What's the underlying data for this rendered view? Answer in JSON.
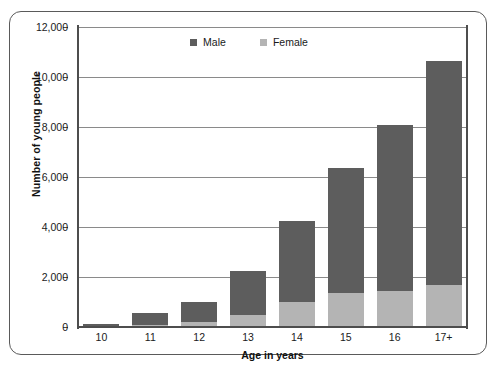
{
  "chart_data": {
    "type": "bar",
    "subtype": "stacked",
    "title": "",
    "xlabel": "Age in years",
    "ylabel": "Number of young people",
    "categories": [
      "10",
      "11",
      "12",
      "13",
      "14",
      "15",
      "16",
      "17+"
    ],
    "series": [
      {
        "name": "Female",
        "color": "#b4b4b4",
        "values": [
          40,
          80,
          200,
          500,
          1000,
          1350,
          1450,
          1700
        ]
      },
      {
        "name": "Male",
        "color": "#5d5d5d",
        "values": [
          90,
          470,
          800,
          1750,
          3250,
          5000,
          6650,
          8950
        ]
      }
    ],
    "totals": [
      130,
      550,
      1000,
      2250,
      4250,
      6350,
      8100,
      10650
    ],
    "ylim": [
      0,
      12000
    ],
    "yticks": [
      0,
      2000,
      4000,
      6000,
      8000,
      10000,
      12000
    ],
    "ytick_labels": [
      "0",
      "2,000",
      "4,000",
      "6,000",
      "8,000",
      "10,000",
      "12,000"
    ],
    "grid": true,
    "legend_position": "top-center",
    "legend": [
      {
        "label": "Male",
        "color": "#5d5d5d",
        "icon": "square-swatch-icon"
      },
      {
        "label": "Female",
        "color": "#b4b4b4",
        "icon": "square-swatch-icon"
      }
    ]
  }
}
